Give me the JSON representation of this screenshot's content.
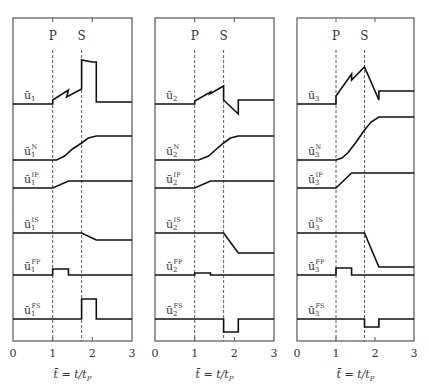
{
  "chart_data": {
    "type": "line",
    "title": "",
    "xlabel": "t̄ = t/t_P",
    "xlim": [
      0,
      3
    ],
    "xticks": [
      0,
      1,
      2,
      3
    ],
    "markers": [
      {
        "label": "P",
        "t": 1.0
      },
      {
        "label": "S",
        "t": 1.73
      }
    ],
    "panels": [
      {
        "name": "component-1",
        "index": "1",
        "rows": [
          {
            "key": "u",
            "label": "ū",
            "sup": "",
            "points": [
              [
                0,
                0
              ],
              [
                1.0,
                0
              ],
              [
                1.0,
                4
              ],
              [
                1.4,
                14
              ],
              [
                1.35,
                7
              ],
              [
                1.73,
                15
              ],
              [
                1.73,
                44
              ],
              [
                2.0,
                42
              ],
              [
                2.1,
                42
              ],
              [
                2.1,
                2
              ],
              [
                3,
                2
              ]
            ]
          },
          {
            "key": "N",
            "label": "ū",
            "sup": "N",
            "points": [
              [
                0,
                0
              ],
              [
                1.1,
                0
              ],
              [
                1.3,
                4
              ],
              [
                1.5,
                11
              ],
              [
                1.73,
                17
              ],
              [
                1.9,
                22
              ],
              [
                2.1,
                24
              ],
              [
                3,
                24
              ]
            ]
          },
          {
            "key": "IP",
            "label": "ū",
            "sup": "IP",
            "points": [
              [
                0,
                0
              ],
              [
                1.0,
                0
              ],
              [
                1.4,
                7
              ],
              [
                3,
                7
              ]
            ]
          },
          {
            "key": "IS",
            "label": "ū",
            "sup": "IS",
            "points": [
              [
                0,
                0
              ],
              [
                1.73,
                0
              ],
              [
                2.1,
                -7
              ],
              [
                3,
                -7
              ]
            ]
          },
          {
            "key": "FP",
            "label": "ū",
            "sup": "FP",
            "points": [
              [
                0,
                0
              ],
              [
                1.0,
                0
              ],
              [
                1.0,
                6
              ],
              [
                1.4,
                6
              ],
              [
                1.4,
                0
              ],
              [
                3,
                0
              ]
            ]
          },
          {
            "key": "FS",
            "label": "ū",
            "sup": "FS",
            "points": [
              [
                0,
                0
              ],
              [
                1.73,
                0
              ],
              [
                1.73,
                20
              ],
              [
                2.1,
                20
              ],
              [
                2.1,
                0
              ],
              [
                3,
                0
              ]
            ]
          }
        ]
      },
      {
        "name": "component-2",
        "index": "2",
        "rows": [
          {
            "key": "u",
            "label": "ū",
            "sup": "",
            "points": [
              [
                0,
                0
              ],
              [
                1.0,
                0
              ],
              [
                1.0,
                3
              ],
              [
                1.4,
                12
              ],
              [
                1.38,
                10
              ],
              [
                1.73,
                18
              ],
              [
                1.73,
                4
              ],
              [
                2.1,
                -10
              ],
              [
                2.1,
                4
              ],
              [
                3,
                4
              ]
            ]
          },
          {
            "key": "N",
            "label": "ū",
            "sup": "N",
            "points": [
              [
                0,
                0
              ],
              [
                1.1,
                0
              ],
              [
                1.35,
                4
              ],
              [
                1.55,
                11
              ],
              [
                1.73,
                17
              ],
              [
                1.9,
                22
              ],
              [
                2.1,
                24
              ],
              [
                3,
                24
              ]
            ]
          },
          {
            "key": "IP",
            "label": "ū",
            "sup": "IP",
            "points": [
              [
                0,
                0
              ],
              [
                1.0,
                0
              ],
              [
                1.4,
                7
              ],
              [
                3,
                7
              ]
            ]
          },
          {
            "key": "IS",
            "label": "ū",
            "sup": "IS",
            "points": [
              [
                0,
                0
              ],
              [
                1.73,
                0
              ],
              [
                2.1,
                -20
              ],
              [
                3,
                -20
              ]
            ]
          },
          {
            "key": "FP",
            "label": "ū",
            "sup": "FP",
            "points": [
              [
                0,
                0
              ],
              [
                1.0,
                0
              ],
              [
                1.0,
                2
              ],
              [
                1.4,
                2
              ],
              [
                1.4,
                0
              ],
              [
                3,
                0
              ]
            ]
          },
          {
            "key": "FS",
            "label": "ū",
            "sup": "FS",
            "points": [
              [
                0,
                0
              ],
              [
                1.73,
                0
              ],
              [
                1.73,
                -13
              ],
              [
                2.1,
                -13
              ],
              [
                2.1,
                0
              ],
              [
                3,
                0
              ]
            ]
          }
        ]
      },
      {
        "name": "component-3",
        "index": "3",
        "rows": [
          {
            "key": "u",
            "label": "ū",
            "sup": "",
            "points": [
              [
                0,
                0
              ],
              [
                1.0,
                0
              ],
              [
                1.0,
                8
              ],
              [
                1.4,
                30
              ],
              [
                1.4,
                24
              ],
              [
                1.73,
                37
              ],
              [
                2.1,
                4
              ],
              [
                2.1,
                13
              ],
              [
                3,
                13
              ]
            ]
          },
          {
            "key": "N",
            "label": "ū",
            "sup": "N",
            "points": [
              [
                0,
                0
              ],
              [
                1.0,
                0
              ],
              [
                1.15,
                2
              ],
              [
                1.3,
                7
              ],
              [
                1.5,
                17
              ],
              [
                1.73,
                30
              ],
              [
                1.9,
                38
              ],
              [
                2.1,
                43
              ],
              [
                3,
                43
              ]
            ]
          },
          {
            "key": "IP",
            "label": "ū",
            "sup": "IP",
            "points": [
              [
                0,
                0
              ],
              [
                1.0,
                0
              ],
              [
                1.4,
                15
              ],
              [
                3,
                15
              ]
            ]
          },
          {
            "key": "IS",
            "label": "ū",
            "sup": "IS",
            "points": [
              [
                0,
                0
              ],
              [
                1.73,
                0
              ],
              [
                2.1,
                -34
              ],
              [
                3,
                -34
              ]
            ]
          },
          {
            "key": "FP",
            "label": "ū",
            "sup": "FP",
            "points": [
              [
                0,
                0
              ],
              [
                1.0,
                0
              ],
              [
                1.0,
                7
              ],
              [
                1.4,
                7
              ],
              [
                1.4,
                0
              ],
              [
                3,
                0
              ]
            ]
          },
          {
            "key": "FS",
            "label": "ū",
            "sup": "FS",
            "points": [
              [
                0,
                0
              ],
              [
                1.73,
                0
              ],
              [
                1.73,
                -8
              ],
              [
                2.1,
                -8
              ],
              [
                2.1,
                0
              ],
              [
                3,
                0
              ]
            ]
          }
        ]
      }
    ],
    "grid": false,
    "legend": "none"
  },
  "layout": {
    "panels_x": [
      [
        13,
        132
      ],
      [
        155,
        274
      ],
      [
        297,
        414
      ]
    ],
    "top": 18,
    "bottom": 341,
    "row_baselines": [
      104,
      160,
      188,
      233,
      275,
      319
    ],
    "marker_label_y": 40,
    "tick_label_y": 357,
    "xlabel_y": 378
  }
}
